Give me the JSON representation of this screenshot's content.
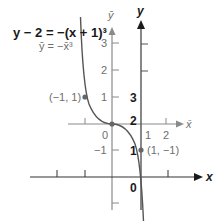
{
  "equations": {
    "main": "y − 2 = −(x + 1)³",
    "translated": "ȳ = −x̄³"
  },
  "axes": {
    "y_label": "y",
    "ybar_label": "ȳ",
    "x_label": "x",
    "xbar_label": "x̄"
  },
  "ticks": {
    "ybar": [
      "3",
      "2",
      "1",
      "0",
      "−1"
    ],
    "xbar": [
      "1",
      "2"
    ],
    "y": [
      "3",
      "2",
      "1",
      "0"
    ]
  },
  "points": [
    {
      "label": "(−1, 1)"
    },
    {
      "label": "(1, −1)"
    }
  ],
  "colors": {
    "dark": "#1a1a1a",
    "gray": "#7a7a7a",
    "curve": "#555555"
  }
}
